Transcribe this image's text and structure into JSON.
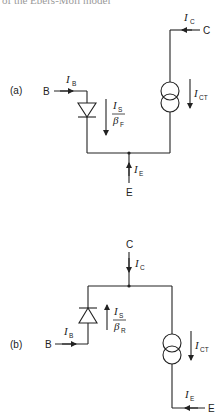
{
  "header": {
    "caption": "of the Ebers-Moll model"
  },
  "circuits": {
    "a": {
      "label": "(a)",
      "terminals": {
        "base": "B",
        "collector": "C",
        "emitter": "E"
      },
      "currents": {
        "base": {
          "symbol": "I",
          "sub": "B"
        },
        "collector": {
          "symbol": "I",
          "sub": "C"
        },
        "emitter": {
          "symbol": "I",
          "sub": "E"
        },
        "source": {
          "symbol": "I",
          "sub": "CT"
        },
        "diode_num": {
          "symbol": "I",
          "sub": "S"
        },
        "diode_den": {
          "symbol": "β",
          "sub": "F"
        }
      }
    },
    "b": {
      "label": "(b)",
      "terminals": {
        "base": "B",
        "collector": "C",
        "emitter": "E"
      },
      "currents": {
        "base": {
          "symbol": "I",
          "sub": "B"
        },
        "collector": {
          "symbol": "I",
          "sub": "C"
        },
        "emitter": {
          "symbol": "I",
          "sub": "E"
        },
        "source": {
          "symbol": "I",
          "sub": "CT"
        },
        "diode_num": {
          "symbol": "I",
          "sub": "S"
        },
        "diode_den": {
          "symbol": "β",
          "sub": "R"
        }
      }
    }
  }
}
